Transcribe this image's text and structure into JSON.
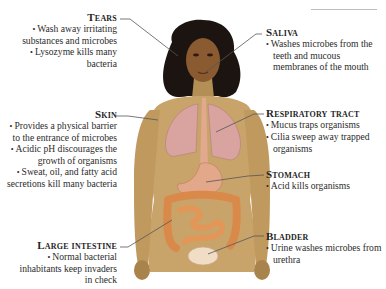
{
  "diagram": {
    "labels_left": [
      {
        "id": "tears",
        "title": "Tears",
        "bullets": [
          "Wash away irritating substances and microbes",
          "Lysozyme kills many bacteria"
        ]
      },
      {
        "id": "skin",
        "title": "Skin",
        "bullets": [
          "Provides a physical barrier to the entrance of microbes",
          "Acidic pH discourages the growth of organisms",
          "Sweat, oil, and fatty acid secretions kill many bacteria"
        ]
      },
      {
        "id": "large-intestine",
        "title": "Large intestine",
        "bullets": [
          "Normal bacterial inhabitants keep invaders in check"
        ]
      }
    ],
    "labels_right": [
      {
        "id": "saliva",
        "title": "Saliva",
        "bullets": [
          "Washes microbes from the teeth and mucous membranes of the mouth"
        ]
      },
      {
        "id": "respiratory-tract",
        "title": "Respiratory tract",
        "bullets": [
          "Mucus traps organisms",
          "Cilia sweep away trapped organisms"
        ]
      },
      {
        "id": "stomach",
        "title": "Stomach",
        "bullets": [
          "Acid kills organisms"
        ]
      },
      {
        "id": "bladder",
        "title": "Bladder",
        "bullets": [
          "Urine washes microbes from urethra"
        ]
      }
    ],
    "bullet_glyph": "•",
    "colors": {
      "skin": "#c9a46a",
      "skin_shadow": "#9c7a45",
      "hair": "#1c1410",
      "lungs": "#d9a3a0",
      "stomach": "#e3a789",
      "intestine": "#d98a4a",
      "bladder": "#f1dcc6",
      "leader_line": "#555555",
      "text": "#2b2b2b"
    }
  }
}
